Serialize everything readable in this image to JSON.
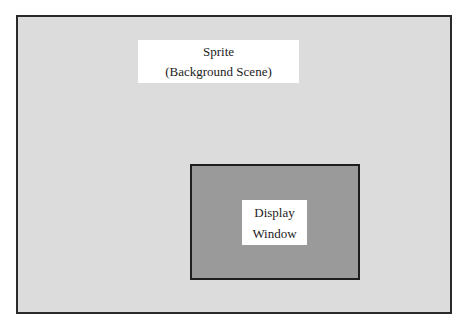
{
  "diagram": {
    "sprite": {
      "label_line1": "Sprite",
      "label_line2": "(Background Scene)",
      "fill_color": "#dcdcdc",
      "border_color": "#2a2a2a"
    },
    "display_window": {
      "label_line1": "Display",
      "label_line2": "Window",
      "fill_color": "#9a9a9a",
      "border_color": "#1e1e1e"
    }
  }
}
